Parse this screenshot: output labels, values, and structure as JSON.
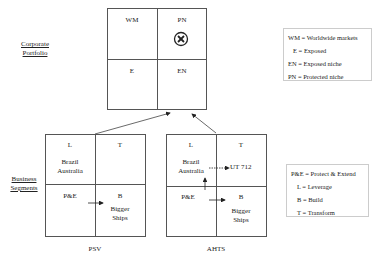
{
  "corporate": {
    "side_label_line1": "Corporate",
    "side_label_line2": "Portfolio",
    "cells": {
      "top_left": "WM",
      "top_right": "PN",
      "bottom_left": "E",
      "bottom_right": "EN"
    },
    "marker_icon": "circled-x"
  },
  "business": {
    "side_label_line1": "Business",
    "side_label_line2": "Segments"
  },
  "psv": {
    "title": "PSV",
    "cells": {
      "top_left": "L",
      "top_right": "T",
      "bottom_left": "P&E",
      "bottom_right": "B"
    },
    "top_left_text_1": "Brazil",
    "top_left_text_2": "Australia",
    "bottom_right_text_1": "Bigger",
    "bottom_right_text_2": "Ships"
  },
  "ahts": {
    "title": "AHTS",
    "cells": {
      "top_left": "L",
      "top_right": "T",
      "bottom_left": "P&E",
      "bottom_right": "B"
    },
    "top_left_text_1": "Brazil",
    "top_left_text_2": "Australia",
    "top_right_text": "UT 712",
    "bottom_right_text_1": "Bigger",
    "bottom_right_text_2": "Ships"
  },
  "legend_portfolio": [
    "WM  = Worldwide markets",
    "E  = Exposed",
    "EN = Exposed niche",
    "PN = Protected niche"
  ],
  "legend_strategy": [
    "P&E = Protect & Extend",
    "L = Leverage",
    "B = Build",
    "T = Transform"
  ]
}
